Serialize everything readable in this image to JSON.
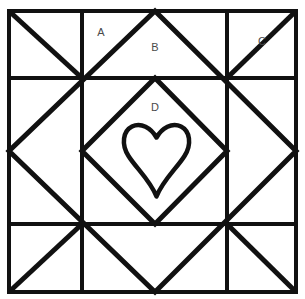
{
  "figure": {
    "kind": "quilt-block-diagram",
    "title": "",
    "background_color": "#ffffff",
    "line_color": "#111111",
    "label_color": "#4a4a4a",
    "canvas": {
      "width": 305,
      "height": 299
    }
  },
  "outer_square": {
    "name": "block-border",
    "x": 9,
    "y": 11,
    "width": 287,
    "height": 281,
    "stroke_width": 4
  },
  "grid": {
    "vertical_lines": [
      82,
      227
    ],
    "horizontal_lines": [
      78,
      224
    ],
    "stroke_width": 4
  },
  "large_diamond": {
    "name": "outer-diamond",
    "points": "155,11 296,151 155,292 9,151",
    "stroke_width": 5
  },
  "inner_diamond": {
    "name": "inner-diamond",
    "points": "155,78 227,151 155,224 82,151",
    "stroke_width": 5
  },
  "corner_diagonals": [
    {
      "name": "corner-diagonal-top-left",
      "x1": 82,
      "y1": 78,
      "x2": 9,
      "y2": 11
    },
    {
      "name": "corner-diagonal-top-right",
      "x1": 227,
      "y1": 78,
      "x2": 296,
      "y2": 11
    },
    {
      "name": "corner-diagonal-bottom-left",
      "x1": 82,
      "y1": 224,
      "x2": 9,
      "y2": 292
    },
    {
      "name": "corner-diagonal-bottom-right",
      "x1": 227,
      "y1": 224,
      "x2": 296,
      "y2": 292
    }
  ],
  "heart": {
    "name": "heart-applique",
    "path": "M 156.5 196.5 C 150 180 136 168 128.5 156 C 121 144 123 131 132 126.5 C 141 122 151 128 156.5 137.5 C 162 128 172 122 181 126.5 C 190 131 192 144 184.5 156 C 177 168 163 180 156.5 196.5 Z",
    "stroke_width": 4.5,
    "bounds": {
      "x": 124,
      "y": 123,
      "width": 65,
      "height": 74
    }
  },
  "labels": [
    {
      "id": "A",
      "text": "A",
      "x": 101,
      "y": 33
    },
    {
      "id": "B",
      "text": "B",
      "x": 155,
      "y": 48
    },
    {
      "id": "C",
      "text": "C",
      "x": 262,
      "y": 42
    },
    {
      "id": "D",
      "text": "D",
      "x": 155,
      "y": 108
    }
  ],
  "top_artifact": {
    "text": "· · · · · · · · · · · · · · · · · · · ·"
  }
}
